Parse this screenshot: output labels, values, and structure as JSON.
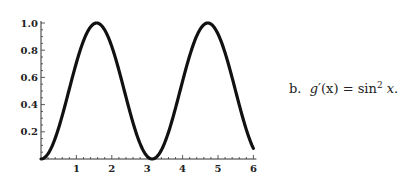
{
  "chart_data": {
    "type": "line",
    "title": "",
    "xlabel": "",
    "ylabel": "",
    "function": "sin^2(x)",
    "xlim": [
      0,
      6
    ],
    "ylim": [
      0,
      1.0
    ],
    "x_ticks": [
      "1",
      "2",
      "3",
      "4",
      "5",
      "6"
    ],
    "y_ticks": [
      "0.2",
      "0.4",
      "0.6",
      "0.8",
      "1.0"
    ],
    "grid": false,
    "legend": null,
    "series": [
      {
        "name": "g'(x) = sin^2 x",
        "x": [
          0,
          0.5,
          1.0,
          1.5708,
          2.0,
          2.5,
          3.1416,
          3.5,
          4.0,
          4.7124,
          5.0,
          5.5,
          6.0
        ],
        "values": [
          0,
          0.23,
          0.708,
          1.0,
          0.827,
          0.358,
          0,
          0.123,
          0.573,
          1.0,
          0.919,
          0.499,
          0.078
        ]
      }
    ]
  },
  "caption": {
    "label": "b.",
    "fn_name": "g",
    "prime": "′",
    "arg": "(x)",
    "equals": " = ",
    "rhs_fn": "sin",
    "rhs_exp": "2",
    "rhs_var": "x",
    "end": "."
  }
}
